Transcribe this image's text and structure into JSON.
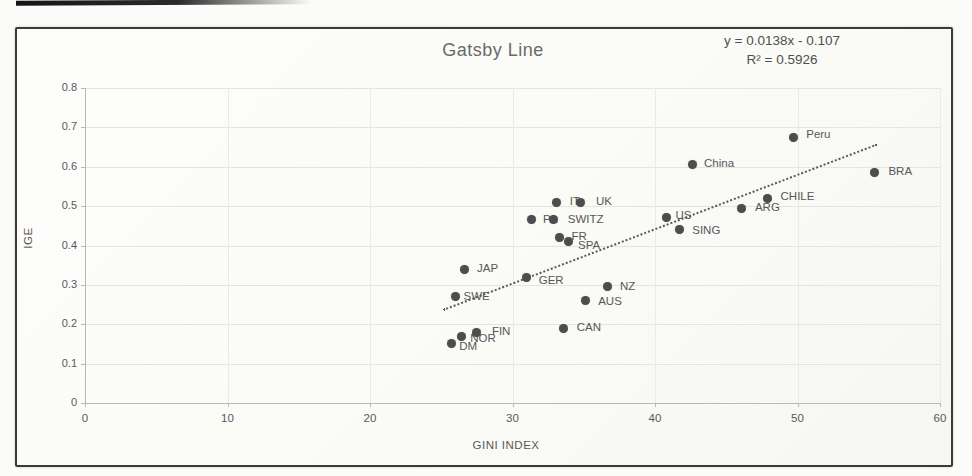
{
  "chart_data": {
    "type": "scatter",
    "title": "Gatsby Line",
    "xlabel": "GINI INDEX",
    "ylabel": "IGE",
    "xlim": [
      0,
      60
    ],
    "ylim": [
      0,
      0.8
    ],
    "grid": true,
    "legend": "none",
    "x_ticks": {
      "values": [
        0,
        10,
        20,
        30,
        40,
        50,
        60
      ],
      "labels": [
        "0",
        "10",
        "20",
        "30",
        "40",
        "50",
        "60"
      ]
    },
    "y_ticks": {
      "values": [
        0,
        0.1,
        0.2,
        0.3,
        0.4,
        0.5,
        0.6,
        0.7,
        0.8
      ],
      "labels": [
        "0",
        "0.1",
        "0.2",
        "0.3",
        "0.4",
        "0.5",
        "0.6",
        "0.7",
        "0.8"
      ]
    },
    "trendline": {
      "label_line1": "y = 0.0138x - 0.107",
      "label_line2": "R² = 0.5926",
      "slope": 0.0138,
      "intercept": -0.107,
      "r2": 0.5926,
      "x_start": 25.1,
      "x_end": 55.5,
      "style": "dotted"
    },
    "points": [
      {
        "label": "DM",
        "x": 25.7,
        "y": 0.15,
        "lx": 8,
        "ly": -4
      },
      {
        "label": "NOR",
        "x": 26.4,
        "y": 0.17,
        "lx": 9,
        "ly": -4
      },
      {
        "label": "FIN",
        "x": 27.5,
        "y": 0.18,
        "lx": 15,
        "ly": -7
      },
      {
        "label": "SWE",
        "x": 26.0,
        "y": 0.27,
        "lx": 8,
        "ly": -7
      },
      {
        "label": "JAP",
        "x": 26.6,
        "y": 0.34,
        "lx": 13,
        "ly": -7
      },
      {
        "label": "GER",
        "x": 31.0,
        "y": 0.32,
        "lx": 12,
        "ly": -3
      },
      {
        "label": "CAN",
        "x": 33.6,
        "y": 0.19,
        "lx": 13,
        "ly": -7
      },
      {
        "label": "AUS",
        "x": 35.1,
        "y": 0.26,
        "lx": 13,
        "ly": -6
      },
      {
        "label": "NZ",
        "x": 36.7,
        "y": 0.295,
        "lx": 12,
        "ly": -7
      },
      {
        "label": "FR",
        "x": 33.3,
        "y": 0.42,
        "lx": 12,
        "ly": -8
      },
      {
        "label": "SPA",
        "x": 33.9,
        "y": 0.41,
        "lx": 10,
        "ly": -3
      },
      {
        "label": "PA",
        "x": 31.3,
        "y": 0.465,
        "lx": 12,
        "ly": -7
      },
      {
        "label": "SWITZ",
        "x": 32.9,
        "y": 0.465,
        "lx": 14,
        "ly": -7
      },
      {
        "label": "IT",
        "x": 33.1,
        "y": 0.51,
        "lx": 13,
        "ly": -7
      },
      {
        "label": "UK",
        "x": 34.8,
        "y": 0.51,
        "lx": 15,
        "ly": -7
      },
      {
        "label": "US",
        "x": 40.8,
        "y": 0.47,
        "lx": 9,
        "ly": -9
      },
      {
        "label": "SING",
        "x": 41.7,
        "y": 0.44,
        "lx": 13,
        "ly": -6
      },
      {
        "label": "China",
        "x": 42.6,
        "y": 0.605,
        "lx": 12,
        "ly": -8
      },
      {
        "label": "ARG",
        "x": 46.1,
        "y": 0.495,
        "lx": 13,
        "ly": -7
      },
      {
        "label": "CHILE",
        "x": 47.9,
        "y": 0.52,
        "lx": 13,
        "ly": -8
      },
      {
        "label": "Peru",
        "x": 49.7,
        "y": 0.675,
        "lx": 13,
        "ly": -9
      },
      {
        "label": "BRA",
        "x": 55.4,
        "y": 0.585,
        "lx": 14,
        "ly": -8
      }
    ]
  },
  "colors": {
    "dot": "#4d4d4d",
    "point_label": "#575757",
    "trendline": "#5a5a5a",
    "grid_horizontal": "#e4e4e0",
    "grid_vertical": "#eaeae6",
    "axis": "#b9b9b5",
    "frame_border": "#3a3a3a",
    "title_text": "#6a6a6a",
    "tick_text": "#595959"
  }
}
